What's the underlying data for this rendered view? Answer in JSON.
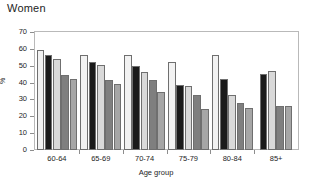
{
  "chart_data": {
    "type": "bar",
    "title": "Women",
    "xlabel": "Age group",
    "ylabel": "%",
    "ylim": [
      0,
      70
    ],
    "ytick_step": 10,
    "yticks": [
      "0",
      "10",
      "20",
      "30",
      "40",
      "50",
      "60",
      "70"
    ],
    "grid": false,
    "legend": "none",
    "categories": [
      "60-64",
      "65-69",
      "70-74",
      "75-79",
      "80-84",
      "85+"
    ],
    "series": [
      {
        "name": "series-1",
        "color": "#f2f2f2",
        "values": [
          59.5,
          56.5,
          56.5,
          52.5,
          56.5,
          null
        ]
      },
      {
        "name": "series-2",
        "color": "#1a1a1a",
        "values": [
          56.3,
          52.2,
          50.0,
          38.3,
          42.4,
          45.0
        ]
      },
      {
        "name": "series-3",
        "color": "#d9d9d9",
        "values": [
          54.2,
          50.2,
          46.0,
          38.0,
          32.5,
          46.6
        ]
      },
      {
        "name": "series-4",
        "color": "#7f7f7f",
        "values": [
          44.3,
          41.4,
          41.4,
          32.5,
          27.8,
          26.0
        ]
      },
      {
        "name": "series-5",
        "color": "#a6a6a6",
        "values": [
          42.4,
          39.2,
          34.4,
          24.3,
          24.7,
          26.1
        ]
      }
    ]
  },
  "axes": {
    "y_title": "%",
    "x_title": "Age group"
  },
  "colors": {
    "frame": "#b9b9b9",
    "bar_outline": "#6f6f6f",
    "text": "#1d1d1d",
    "background": "#ffffff"
  }
}
